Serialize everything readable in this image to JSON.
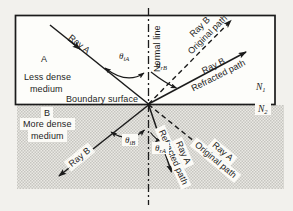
{
  "figure": {
    "title_semantic": "Refraction of light at a boundary between two media",
    "colors": {
      "ink": "#1b1b1b",
      "page": "#f2f1ed",
      "medium_a_fill": "#fdfdfa",
      "medium_b_dot": "#c6c5c0",
      "medium_b_base": "#eae9e4",
      "label_box": "#fbfaf6"
    },
    "media": {
      "a_letter": "A",
      "a_line1": "Less dense",
      "a_line2": "medium",
      "b_letter": "B",
      "b_line1": "More dense",
      "b_line2": "medium"
    },
    "boundary_label": "Boundary surface",
    "normal_label": "Normal line",
    "indices": {
      "n": "N",
      "sub1": "1",
      "sub2": "2"
    },
    "rays": {
      "ray_a_incident": "Ray A",
      "ray_b_incident": "Ray B",
      "ray_b_original": {
        "line1": "Ray B",
        "line2": "Original path"
      },
      "ray_b_refracted": {
        "line1": "Ray B",
        "line2": "Refracted path"
      },
      "ray_a_refracted": {
        "line1": "Ray A",
        "line2": "Refracted path"
      },
      "ray_a_original": {
        "line1": "Ray A",
        "line2": "Original path"
      }
    },
    "angles": {
      "theta": "θ",
      "ia_sub": "iA",
      "rb_sub": "rB",
      "ib_sub": "iB",
      "ra_sub": "rA"
    }
  }
}
